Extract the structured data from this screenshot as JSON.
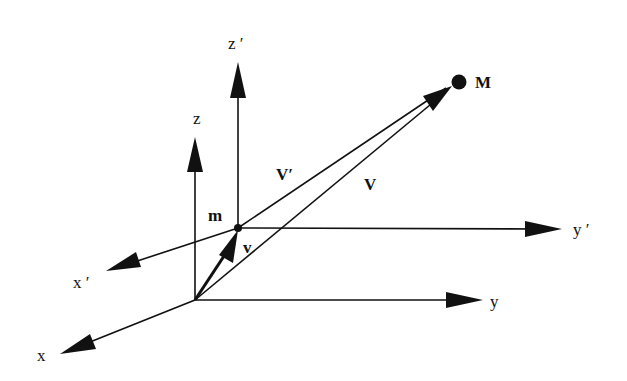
{
  "diagram": {
    "type": "coordinate-frames-vector-diagram",
    "colors": {
      "ink": "#111111",
      "background": "#ffffff"
    },
    "frames": {
      "fixed": {
        "origin": "O",
        "axes": {
          "x": "x",
          "y": "y",
          "z": "z"
        }
      },
      "moving": {
        "origin": "m",
        "axes": {
          "x": "x ′",
          "y": "y ′",
          "z": "z ′"
        }
      }
    },
    "labels": {
      "x": "x",
      "y": "y",
      "z": "z",
      "x_prime": "x ′",
      "y_prime": "y ′",
      "z_prime": "z ′",
      "point_m": "m",
      "point_M": "M",
      "vector_v_small": "v",
      "vector_V": "V",
      "vector_V_prime": "V′"
    },
    "vectors": [
      {
        "name": "v",
        "from": "O",
        "to": "m",
        "style": "thick"
      },
      {
        "name": "V",
        "from": "O",
        "to": "M"
      },
      {
        "name": "V′",
        "from": "m",
        "to": "M"
      }
    ]
  }
}
